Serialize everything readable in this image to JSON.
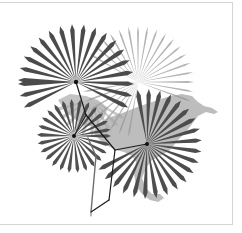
{
  "figure": {
    "type": "phylogeny-map",
    "colors": {
      "background": "#ffffff",
      "frame": "#d4d4d4",
      "map": "#b8b8b8",
      "leaf_dark": "#4a4a4a",
      "leaf_light": "#8c8c8c",
      "branch": "#1a1a1a",
      "branch_gray": "#6a6a6a"
    },
    "tree": {
      "root": {
        "x": 91,
        "y": 212
      },
      "internal_nodes": [
        {
          "id": "n1",
          "x": 109,
          "y": 200
        },
        {
          "id": "n2",
          "x": 115,
          "y": 150
        },
        {
          "id": "n3",
          "x": 86,
          "y": 115
        }
      ],
      "tips": [
        {
          "id": "tip-top-left",
          "x": 76,
          "y": 82
        },
        {
          "id": "tip-left",
          "x": 74,
          "y": 136
        },
        {
          "id": "tip-right",
          "x": 147,
          "y": 144
        }
      ]
    },
    "palms": [
      {
        "id": "palm-top-left",
        "cx": 76,
        "cy": 82,
        "r": 58,
        "style": "dark"
      },
      {
        "id": "palm-left",
        "cx": 74,
        "cy": 136,
        "r": 36,
        "style": "dark"
      },
      {
        "id": "palm-right",
        "cx": 147,
        "cy": 144,
        "r": 55,
        "style": "dark"
      },
      {
        "id": "palm-background",
        "cx": 138,
        "cy": 82,
        "r": 55,
        "style": "light"
      }
    ]
  }
}
